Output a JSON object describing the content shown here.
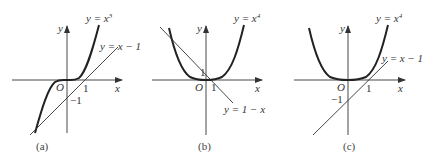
{
  "panels": [
    {
      "caption": "(a)",
      "curve_label": "y = x",
      "curve_exp": "3",
      "line_label": "y = x − 1",
      "origin": "O",
      "x_axis": "x",
      "y_axis": "y",
      "tick_x": "1",
      "tick_y": "−1"
    },
    {
      "caption": "(b)",
      "curve_label": "y = x",
      "curve_exp": "4",
      "line_label": "y = 1 − x",
      "origin": "O",
      "x_axis": "x",
      "y_axis": "y",
      "tick_x": "1",
      "tick_y": "1"
    },
    {
      "caption": "(c)",
      "curve_label": "y = x",
      "curve_exp": "4",
      "line_label": "y = x − 1",
      "origin": "O",
      "x_axis": "x",
      "y_axis": "y",
      "tick_x": "1",
      "tick_y": "−1"
    }
  ],
  "colors": {
    "curve": "#222222",
    "line": "#333333",
    "axis": "#333333"
  }
}
